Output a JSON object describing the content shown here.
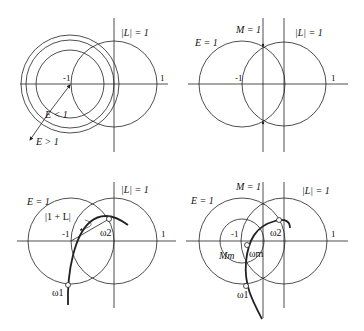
{
  "panels": {
    "top_left": {
      "label_L": "|L| = 1",
      "tick_neg1": "-1",
      "tick_pos1": "1",
      "label_E_less": "E < 1",
      "label_E_greater": "E > 1"
    },
    "top_right": {
      "label_M": "M = 1",
      "label_L": "|L| = 1",
      "label_E": "E = 1",
      "tick_neg1": "-1",
      "tick_pos1": "1"
    },
    "bottom_left": {
      "label_E": "E = 1",
      "label_L": "|L| = 1",
      "label_1plusL": "|1 + L|",
      "tick_neg1": "-1",
      "tick_pos1": "1",
      "omega1": "ω1",
      "omega2": "ω2"
    },
    "bottom_right": {
      "label_M": "M = 1",
      "label_L": "|L| = 1",
      "label_E": "E = 1",
      "label_Mm": "Mm",
      "tick_neg1": "-1",
      "tick_pos1": "1",
      "omega1": "ω1",
      "omega2": "ω2",
      "omegam": "ωm"
    }
  },
  "colors": {
    "stroke": "#222222",
    "background": "#ffffff"
  }
}
